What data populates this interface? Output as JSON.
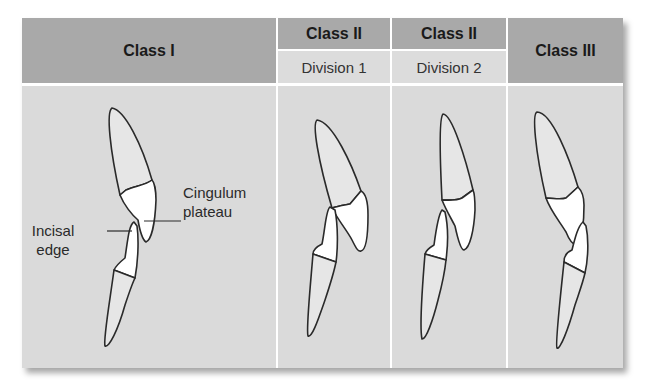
{
  "columns": [
    {
      "title": "Class I",
      "subtitle": null
    },
    {
      "title": "Class II",
      "subtitle": "Division 1"
    },
    {
      "title": "Class II",
      "subtitle": "Division 2"
    },
    {
      "title": "Class III",
      "subtitle": null
    }
  ],
  "annotations": {
    "cingulum_line1": "Cingulum",
    "cingulum_line2": "plateau",
    "incisal_line1": "Incisal",
    "incisal_line2": "edge"
  },
  "colors": {
    "header_dark": "#a9a9a9",
    "header_light": "#dcdcdc",
    "body_bg": "#dadada",
    "outline": "#2a2a2a"
  }
}
